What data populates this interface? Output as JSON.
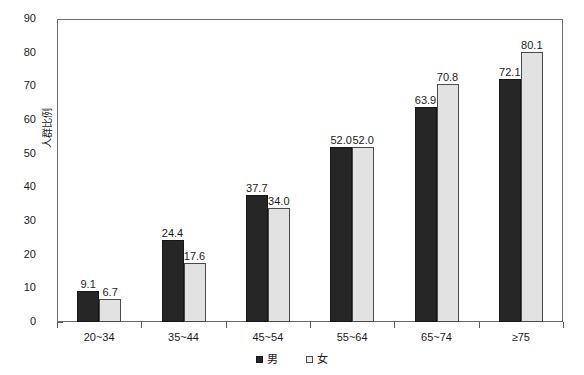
{
  "chart_data": {
    "type": "bar",
    "title": "",
    "xlabel": "",
    "ylabel": "人群比例",
    "categories": [
      "20~34",
      "35~44",
      "45~54",
      "55~64",
      "65~74",
      "≥75"
    ],
    "series": [
      {
        "name": "男",
        "color": "#262626",
        "values": [
          9.1,
          24.4,
          37.7,
          52.0,
          63.9,
          72.1
        ]
      },
      {
        "name": "女",
        "color": "#e2e2e2",
        "values": [
          6.7,
          17.6,
          34.0,
          52.0,
          70.8,
          80.1
        ]
      }
    ],
    "ylim": [
      0,
      90
    ],
    "ytick_values": [
      0,
      10,
      20,
      30,
      40,
      50,
      60,
      70,
      80,
      90
    ],
    "ytick_labels": [
      "0",
      "10",
      "20",
      "30",
      "40",
      "50",
      "60",
      "70",
      "80",
      "90"
    ],
    "y_minor_step": 2,
    "grid": false,
    "legend_position": "bottom",
    "data_labels": true,
    "value_label_format": "one-decimal"
  },
  "legend": {
    "items": [
      {
        "label": "男",
        "swatch": "filled-dark-square"
      },
      {
        "label": "女",
        "swatch": "open-light-square"
      }
    ]
  }
}
